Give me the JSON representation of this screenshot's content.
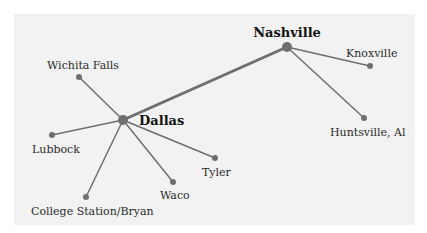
{
  "diagram": {
    "colors": {
      "background": "#ffffff",
      "panel": "#f2f2f2",
      "edge": "#6e6e6e",
      "node": "#6e6e6e",
      "text": "#2a2a2a"
    },
    "hubs": [
      {
        "id": "dallas",
        "label": "Dallas",
        "x": 123,
        "y": 120
      },
      {
        "id": "nashville",
        "label": "Nashville",
        "x": 287,
        "y": 47
      }
    ],
    "spokes": [
      {
        "id": "wichita_falls",
        "label": "Wichita Falls",
        "x": 79,
        "y": 77,
        "hub": "dallas"
      },
      {
        "id": "lubbock",
        "label": "Lubbock",
        "x": 52,
        "y": 135,
        "hub": "dallas"
      },
      {
        "id": "college_station",
        "label": "College Station/Bryan",
        "x": 86,
        "y": 197,
        "hub": "dallas"
      },
      {
        "id": "waco",
        "label": "Waco",
        "x": 173,
        "y": 182,
        "hub": "dallas"
      },
      {
        "id": "tyler",
        "label": "Tyler",
        "x": 215,
        "y": 158,
        "hub": "dallas"
      },
      {
        "id": "knoxville",
        "label": "Knoxville",
        "x": 370,
        "y": 66,
        "hub": "nashville"
      },
      {
        "id": "huntsville",
        "label": "Huntsville, Al",
        "x": 364,
        "y": 118,
        "hub": "nashville"
      }
    ]
  }
}
